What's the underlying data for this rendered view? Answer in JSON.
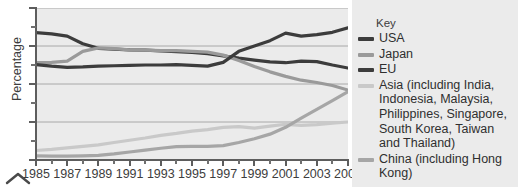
{
  "chart_data": {
    "type": "line",
    "title": "",
    "xlabel": "",
    "ylabel": "Percentage",
    "xlim": [
      1985,
      2005
    ],
    "ylim": [
      0,
      40
    ],
    "ytick_labels": [
      "0",
      "10",
      "20",
      "30",
      "40"
    ],
    "ytick_values": [
      0,
      10,
      20,
      30,
      40
    ],
    "yminor_values": [
      5,
      15,
      25,
      35
    ],
    "xtick_labels": [
      "1985",
      "1987",
      "1989",
      "1991",
      "1993",
      "1995",
      "1997",
      "1999",
      "2001",
      "2003",
      "2005"
    ],
    "xtick_values": [
      1985,
      1987,
      1989,
      1991,
      1993,
      1995,
      1997,
      1999,
      2001,
      2003,
      2005
    ],
    "xminor_values": [
      1986,
      1988,
      1990,
      1992,
      1994,
      1996,
      1998,
      2000,
      2002,
      2004
    ],
    "grid": "horizontal",
    "legend_position": "right",
    "legend_title": "Key",
    "x": [
      1985,
      1986,
      1987,
      1988,
      1989,
      1990,
      1991,
      1992,
      1993,
      1994,
      1995,
      1996,
      1997,
      1998,
      1999,
      2000,
      2001,
      2002,
      2003,
      2004,
      2005
    ],
    "series": [
      {
        "name": "USA",
        "color": "#3c3c3c",
        "values": [
          33.5,
          33.2,
          32.6,
          30.6,
          29.4,
          29.2,
          29.0,
          28.9,
          28.7,
          28.5,
          28.3,
          28.0,
          27.4,
          26.8,
          26.3,
          25.8,
          25.6,
          26.0,
          25.9,
          25.0,
          24.2
        ]
      },
      {
        "name": "Japan",
        "color": "#9a9a9a",
        "values": [
          25.6,
          25.7,
          26.0,
          28.6,
          29.5,
          29.3,
          29.0,
          28.9,
          28.8,
          28.8,
          28.6,
          28.4,
          27.6,
          26.2,
          24.6,
          23.2,
          22.0,
          21.0,
          20.4,
          19.6,
          18.4
        ]
      },
      {
        "name": "EU",
        "color": "#3c3c3c",
        "values": [
          25.1,
          24.7,
          24.4,
          24.5,
          24.7,
          24.8,
          24.9,
          25.0,
          25.0,
          25.1,
          24.9,
          24.7,
          25.7,
          28.6,
          30.0,
          31.4,
          33.4,
          32.6,
          33.0,
          33.6,
          34.8
        ]
      },
      {
        "name": "Asia (including India, Indonesia, Malaysia, Philippines, Singapore, South Korea, Taiwan and Thailand)",
        "color": "#c9c9c9",
        "values": [
          2.5,
          2.8,
          3.2,
          3.6,
          4.0,
          4.6,
          5.2,
          5.8,
          6.5,
          7.0,
          7.6,
          8.0,
          8.6,
          8.8,
          8.4,
          8.9,
          9.4,
          9.1,
          9.3,
          9.7,
          10.0
        ]
      },
      {
        "name": "China (including Hong Kong)",
        "color": "#a6a6a6",
        "values": [
          1.1,
          1.0,
          1.0,
          1.1,
          1.2,
          1.6,
          2.1,
          2.6,
          3.1,
          3.5,
          3.6,
          3.6,
          3.8,
          4.6,
          5.6,
          6.8,
          8.6,
          11.0,
          13.3,
          15.6,
          18.0
        ]
      }
    ]
  },
  "legend": {
    "title": "Key",
    "items": [
      {
        "label": "USA",
        "color": "#3c3c3c"
      },
      {
        "label": "Japan",
        "color": "#9a9a9a"
      },
      {
        "label": "EU",
        "color": "#3c3c3c"
      },
      {
        "label": "Asia (including India, Indonesia, Malaysia, Philippines, Singapore, South Korea, Taiwan and Thailand)",
        "color": "#c9c9c9"
      },
      {
        "label": "China (including Hong Kong)",
        "color": "#a6a6a6"
      }
    ]
  }
}
